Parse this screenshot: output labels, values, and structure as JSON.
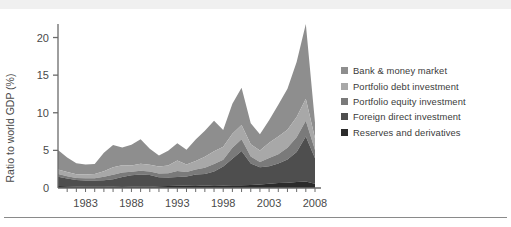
{
  "figure": {
    "background_color": "#ffffff",
    "has_top_scan_band": true,
    "has_bottom_rule": true,
    "rule_color": "#8a8a8a"
  },
  "legend": {
    "position": "right",
    "entries": [
      {
        "label": "Bank & money market",
        "color": "#8e8e8e",
        "swatch_name": "legend-swatch-bank-money-market"
      },
      {
        "label": "Portfolio debt investment",
        "color": "#a8a8a8",
        "swatch_name": "legend-swatch-portfolio-debt"
      },
      {
        "label": "Portfolio equity investment",
        "color": "#7a7a7a",
        "swatch_name": "legend-swatch-portfolio-equity"
      },
      {
        "label": "Foreign direct investment",
        "color": "#4e4e4e",
        "swatch_name": "legend-swatch-foreign-direct"
      },
      {
        "label": "Reserves and derivatives",
        "color": "#2b2b2b",
        "swatch_name": "legend-swatch-reserves-derivatives"
      }
    ]
  },
  "axes": {
    "y_label": "Ratio to world GDP (%)",
    "y_ticks": [
      "0",
      "5",
      "10",
      "15",
      "20"
    ],
    "y_tick_values": [
      0,
      5,
      10,
      15,
      20
    ],
    "x_ticks": [
      "1983",
      "1988",
      "1993",
      "1998",
      "2003",
      "2008"
    ],
    "x_tick_values": [
      1983,
      1988,
      1993,
      1998,
      2003,
      2008
    ],
    "x_minor_tick_interval": 1,
    "axis_color": "#6a6a6a"
  },
  "chart_data": {
    "type": "area",
    "stacked": true,
    "title": "",
    "subtitle": "",
    "xlabel": "",
    "ylabel": "Ratio to world GDP (%)",
    "xlim": [
      1980,
      2008
    ],
    "ylim": [
      0,
      21
    ],
    "grid": false,
    "legend_position": "right",
    "x": [
      1980,
      1981,
      1982,
      1983,
      1984,
      1985,
      1986,
      1987,
      1988,
      1989,
      1990,
      1991,
      1992,
      1993,
      1994,
      1995,
      1996,
      1997,
      1998,
      1999,
      2000,
      2001,
      2002,
      2003,
      2004,
      2005,
      2006,
      2007,
      2008
    ],
    "series": [
      {
        "name": "Reserves and derivatives",
        "color": "#2b2b2b",
        "values": [
          0.25,
          0.22,
          0.2,
          0.18,
          0.18,
          0.18,
          0.2,
          0.22,
          0.2,
          0.18,
          0.18,
          0.22,
          0.25,
          0.3,
          0.32,
          0.35,
          0.3,
          0.35,
          0.32,
          0.35,
          0.38,
          0.4,
          0.45,
          0.55,
          0.65,
          0.7,
          0.8,
          0.85,
          0.55
        ]
      },
      {
        "name": "Foreign direct investment",
        "color": "#4e4e4e",
        "values": [
          1.25,
          1.05,
          0.85,
          0.82,
          0.82,
          0.85,
          0.95,
          1.25,
          1.5,
          1.6,
          1.55,
          1.2,
          1.15,
          1.15,
          1.2,
          1.45,
          1.55,
          1.85,
          2.55,
          3.55,
          4.55,
          2.85,
          2.3,
          2.35,
          2.6,
          3.1,
          4.0,
          6.0,
          3.4
        ]
      },
      {
        "name": "Portfolio equity investment",
        "color": "#7a7a7a",
        "values": [
          0.35,
          0.3,
          0.28,
          0.28,
          0.3,
          0.45,
          0.6,
          0.6,
          0.45,
          0.5,
          0.45,
          0.5,
          0.55,
          0.8,
          0.6,
          0.65,
          0.85,
          1.0,
          0.9,
          1.45,
          1.55,
          0.95,
          0.7,
          1.1,
          1.25,
          1.55,
          1.95,
          2.1,
          1.1
        ]
      },
      {
        "name": "Portfolio debt investment",
        "color": "#a8a8a8",
        "values": [
          0.6,
          0.55,
          0.5,
          0.5,
          0.55,
          0.75,
          1.0,
          0.95,
          0.85,
          0.95,
          0.9,
          0.95,
          1.05,
          1.4,
          1.0,
          1.15,
          1.45,
          1.7,
          1.7,
          1.85,
          1.9,
          1.6,
          1.55,
          2.0,
          2.35,
          2.4,
          2.7,
          2.9,
          1.55
        ]
      },
      {
        "name": "Bank & money market",
        "color": "#8e8e8e",
        "values": [
          2.6,
          1.95,
          1.45,
          1.35,
          1.35,
          2.45,
          2.95,
          2.35,
          2.75,
          3.25,
          2.15,
          1.45,
          1.95,
          2.3,
          1.95,
          2.85,
          3.45,
          4.05,
          2.25,
          4.0,
          4.95,
          2.8,
          2.15,
          3.0,
          4.2,
          5.45,
          7.3,
          9.95,
          2.1
        ]
      }
    ],
    "peak_total": 21.8,
    "peak_year": 2007
  }
}
